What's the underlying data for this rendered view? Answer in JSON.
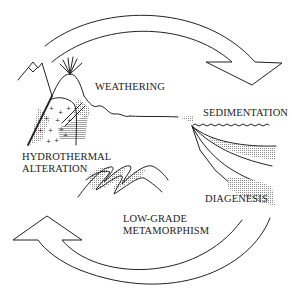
{
  "diagram": {
    "title": "",
    "type": "cycle",
    "labels": {
      "weathering": "WEATHERING",
      "sedimentation": "SEDIMENTATION",
      "hydrothermal_1": "HYDROTHERMAL",
      "hydrothermal_2": "ALTERATION",
      "low_grade_1": "LOW-GRADE",
      "low_grade_2": "METAMORPHISM",
      "diagenesis": "DIAGENESIS"
    },
    "arrows": [
      {
        "name": "top-cycle-arrow",
        "direction": "clockwise",
        "from": "upper-left",
        "to": "right"
      },
      {
        "name": "bottom-cycle-arrow",
        "direction": "clockwise",
        "from": "lower-right",
        "to": "left"
      }
    ],
    "stages": [
      "WEATHERING",
      "SEDIMENTATION",
      "DIAGENESIS",
      "LOW-GRADE METAMORPHISM",
      "HYDROTHERMAL ALTERATION"
    ],
    "colors": {
      "line": "#222222",
      "background": "#ffffff",
      "stipple": "#9a9a9a"
    }
  }
}
